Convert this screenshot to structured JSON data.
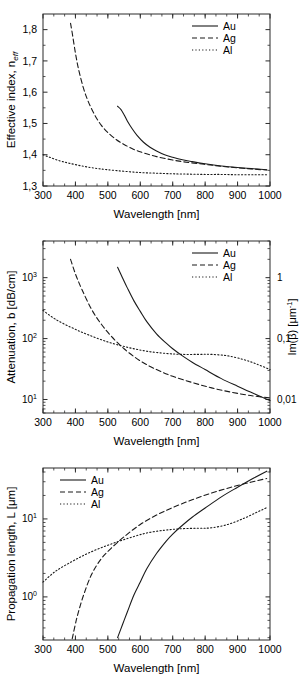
{
  "figure": {
    "background": "#ffffff",
    "line_color": "#1a1a1a",
    "axis_color": "#2b2b2b"
  },
  "xaxis": {
    "label": "Wavelength [nm]",
    "ticks": [
      300,
      400,
      500,
      600,
      700,
      800,
      900,
      1000
    ],
    "min": 300,
    "max": 1000,
    "minor_per_major": 2
  },
  "legend": {
    "entries": [
      {
        "label": "Au",
        "style": "solid"
      },
      {
        "label": "Ag",
        "style": "dashed"
      },
      {
        "label": "Al",
        "style": "dotted"
      }
    ]
  },
  "panels": [
    {
      "id": "effective-index",
      "ylabel_plain": "Effective  index, n",
      "ylabel_sub": "eff",
      "yticks": [
        "1,3",
        "1,4",
        "1,5",
        "1,6",
        "1,7",
        "1,8"
      ],
      "ymin": 1.3,
      "ymax": 1.85,
      "legend_position": "top-right"
    },
    {
      "id": "attenuation",
      "ylabel_plain": "Attenuation, b [dB/cm]",
      "yticks": [
        "10",
        "10",
        "10"
      ],
      "ytick_exponents": [
        "1",
        "2",
        "3"
      ],
      "ymin": 6,
      "ymax": 4000,
      "legend_position": "top-right",
      "right_axis": {
        "label_prefix": "Im(",
        "label_beta": "β",
        "label_suffix": ") [μm",
        "label_exp": "-1",
        "label_end": "]",
        "ticks": [
          "1",
          "0,1",
          "0,01"
        ]
      }
    },
    {
      "id": "propagation-length",
      "ylabel_plain": "Propagation length, L [μm]",
      "yticks": [
        "10",
        "10"
      ],
      "ytick_exponents": [
        "0",
        "1"
      ],
      "ymin": 0.28,
      "ymax": 45,
      "legend_position": "top-left"
    }
  ],
  "chart_data": [
    {
      "type": "line",
      "title": "",
      "xlabel": "Wavelength [nm]",
      "ylabel": "Effective index, n_eff",
      "xlim": [
        300,
        1000
      ],
      "ylim": [
        1.3,
        1.85
      ],
      "grid": false,
      "legend": "top-right",
      "series": [
        {
          "name": "Au",
          "style": "solid",
          "x": [
            530,
            540,
            550,
            560,
            575,
            590,
            610,
            630,
            650,
            675,
            700,
            730,
            760,
            800,
            850,
            900,
            950,
            990
          ],
          "y": [
            1.555,
            1.545,
            1.528,
            1.508,
            1.483,
            1.462,
            1.44,
            1.424,
            1.412,
            1.4,
            1.392,
            1.384,
            1.378,
            1.371,
            1.364,
            1.359,
            1.355,
            1.352
          ]
        },
        {
          "name": "Ag",
          "style": "dashed",
          "x": [
            385,
            390,
            400,
            410,
            425,
            440,
            460,
            480,
            500,
            525,
            550,
            580,
            610,
            650,
            700,
            750,
            800,
            850,
            900,
            950,
            990
          ],
          "y": [
            1.82,
            1.79,
            1.725,
            1.672,
            1.612,
            1.569,
            1.526,
            1.494,
            1.471,
            1.449,
            1.433,
            1.417,
            1.406,
            1.394,
            1.383,
            1.375,
            1.369,
            1.363,
            1.358,
            1.354,
            1.351
          ]
        },
        {
          "name": "Al",
          "style": "dotted",
          "x": [
            300,
            320,
            350,
            380,
            420,
            460,
            500,
            550,
            600,
            650,
            700,
            750,
            800,
            850,
            900,
            950,
            990
          ],
          "y": [
            1.4,
            1.392,
            1.381,
            1.373,
            1.364,
            1.357,
            1.352,
            1.347,
            1.343,
            1.341,
            1.339,
            1.338,
            1.337,
            1.337,
            1.336,
            1.336,
            1.336
          ]
        }
      ]
    },
    {
      "type": "line",
      "title": "",
      "xlabel": "Wavelength [nm]",
      "ylabel": "Attenuation, b [dB/cm]",
      "ylabel_right": "Im(β) [μm^-1]",
      "xlim": [
        300,
        1000
      ],
      "ylim": [
        6,
        4000
      ],
      "yscale": "log",
      "grid": false,
      "legend": "top-right",
      "series": [
        {
          "name": "Au",
          "style": "solid",
          "x": [
            530,
            545,
            560,
            580,
            600,
            620,
            650,
            680,
            700,
            730,
            760,
            800,
            850,
            900,
            950,
            1000
          ],
          "y": [
            1480,
            1000,
            680,
            420,
            280,
            190,
            120,
            84,
            68,
            52,
            41,
            31,
            22,
            16.5,
            12.5,
            9.6
          ]
        },
        {
          "name": "Ag",
          "style": "dashed",
          "x": [
            385,
            400,
            420,
            450,
            480,
            510,
            550,
            600,
            650,
            700,
            760,
            820,
            880,
            940,
            1000
          ],
          "y": [
            2000,
            1150,
            640,
            300,
            172,
            110,
            68,
            43,
            31,
            24,
            19,
            15.5,
            13.2,
            11.6,
            10.6
          ]
        },
        {
          "name": "Al",
          "style": "dotted",
          "x": [
            300,
            340,
            390,
            440,
            500,
            560,
            620,
            680,
            730,
            780,
            820,
            870,
            920,
            960,
            1000
          ],
          "y": [
            290,
            205,
            150,
            115,
            88,
            72,
            62,
            57,
            55,
            55,
            55,
            52,
            45,
            38,
            31
          ]
        }
      ]
    },
    {
      "type": "line",
      "title": "",
      "xlabel": "Wavelength [nm]",
      "ylabel": "Propagation length, L [μm]",
      "xlim": [
        300,
        1000
      ],
      "ylim": [
        0.28,
        45
      ],
      "yscale": "log",
      "grid": false,
      "legend": "top-left",
      "series": [
        {
          "name": "Au",
          "style": "solid",
          "x": [
            530,
            545,
            560,
            580,
            600,
            620,
            650,
            680,
            700,
            730,
            760,
            800,
            850,
            900,
            950,
            990
          ],
          "y": [
            0.3,
            0.44,
            0.64,
            1.05,
            1.55,
            2.3,
            3.6,
            5.2,
            6.4,
            8.3,
            10.5,
            13.8,
            19.2,
            25.5,
            33.5,
            41.0
          ]
        },
        {
          "name": "Ag",
          "style": "dashed",
          "x": [
            390,
            405,
            425,
            450,
            480,
            510,
            550,
            600,
            650,
            700,
            760,
            820,
            880,
            940,
            990
          ],
          "y": [
            0.29,
            0.55,
            1.05,
            1.95,
            3.1,
            4.2,
            5.9,
            8.5,
            11.2,
            14.0,
            17.6,
            21.5,
            25.5,
            29.5,
            33.0
          ]
        },
        {
          "name": "Al",
          "style": "dotted",
          "x": [
            300,
            340,
            390,
            440,
            500,
            560,
            620,
            680,
            730,
            780,
            820,
            870,
            920,
            960,
            990
          ],
          "y": [
            1.55,
            2.15,
            2.85,
            3.65,
            4.6,
            5.6,
            6.6,
            7.2,
            7.5,
            7.6,
            7.7,
            8.5,
            10.2,
            12.2,
            14.0
          ]
        }
      ]
    }
  ]
}
